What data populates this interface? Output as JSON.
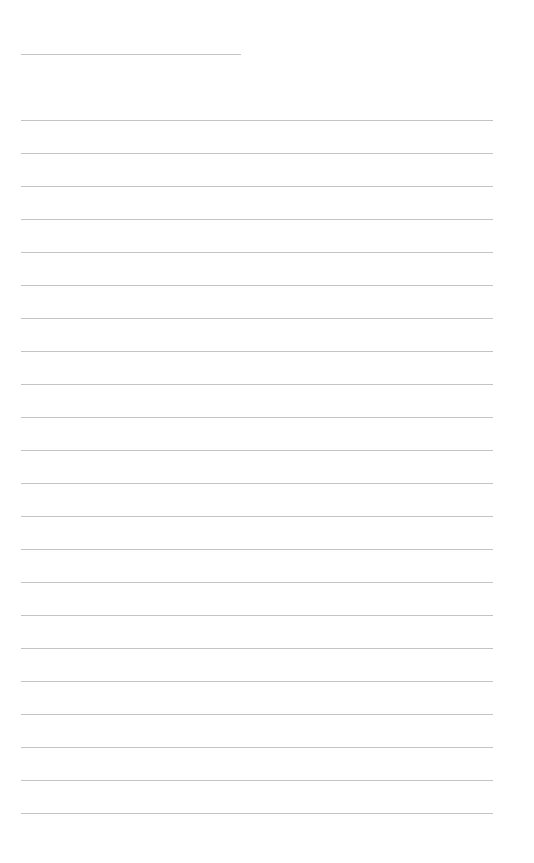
{
  "page": {
    "type": "lined-paper",
    "background": "#ffffff",
    "line_color": "#c4c4c4",
    "header_line": {
      "top": 54,
      "left": 21,
      "width": 220
    },
    "rules": {
      "first_top": 120,
      "spacing": 33,
      "count": 22,
      "left": 21,
      "width": 472
    }
  }
}
